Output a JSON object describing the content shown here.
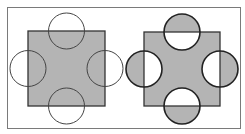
{
  "diagram": {
    "colors": {
      "background": "#ffffff",
      "frame": "#7a7a7a",
      "fill": "#b4b4b4",
      "stroke": "#333333"
    },
    "frame": {
      "x": 7,
      "y": 7,
      "w": 233,
      "h": 121
    },
    "left_panel": {
      "square": {
        "x": 28,
        "y": 31,
        "w": 77,
        "h": 75
      },
      "circle_radius": 18,
      "circles": [
        {
          "cx": 66.5,
          "cy": 31
        },
        {
          "cx": 28,
          "cy": 68.5
        },
        {
          "cx": 105,
          "cy": 68.5
        },
        {
          "cx": 66.5,
          "cy": 106
        }
      ]
    },
    "right_panel": {
      "square": {
        "x": 144,
        "y": 32,
        "w": 76,
        "h": 74
      },
      "circle_radius": 18,
      "circles": [
        {
          "cx": 182,
          "cy": 32
        },
        {
          "cx": 144,
          "cy": 69
        },
        {
          "cx": 220,
          "cy": 69
        },
        {
          "cx": 182,
          "cy": 106
        }
      ]
    }
  }
}
